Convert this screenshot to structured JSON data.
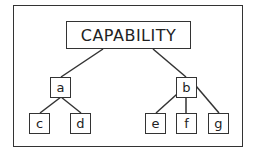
{
  "diagram": {
    "type": "hierarchy-tree",
    "root": {
      "id": "capability",
      "label": "CAPABILITY"
    },
    "nodes": [
      {
        "id": "a",
        "label": "a",
        "parent": "capability"
      },
      {
        "id": "b",
        "label": "b",
        "parent": "capability"
      },
      {
        "id": "c",
        "label": "c",
        "parent": "a"
      },
      {
        "id": "d",
        "label": "d",
        "parent": "a"
      },
      {
        "id": "e",
        "label": "e",
        "parent": "b"
      },
      {
        "id": "f",
        "label": "f",
        "parent": "b"
      },
      {
        "id": "g",
        "label": "g",
        "parent": "b"
      }
    ],
    "colors": {
      "line": "#333333",
      "background": "#ffffff",
      "text": "#222222"
    }
  }
}
